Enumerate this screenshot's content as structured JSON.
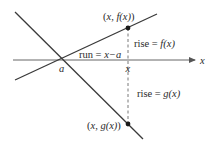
{
  "diagram": {
    "type": "two-line slope comparison",
    "colors": {
      "line": "#3a3a3a",
      "axis": "#555555",
      "dashed": "#555555",
      "point": "#1a1a1a",
      "text": "#2a2a2a"
    },
    "axis": {
      "label": "x",
      "from": [
        13,
        60
      ],
      "to": [
        197,
        60
      ]
    },
    "lines": {
      "f_line": {
        "name": "f",
        "from": [
          15,
          80
        ],
        "to": [
          157,
          14
        ]
      },
      "g_line": {
        "name": "g",
        "from": [
          15,
          12
        ],
        "to": [
          143,
          139
        ]
      }
    },
    "points": {
      "a": {
        "label": "a",
        "x": 62,
        "y": 59
      },
      "f_point": {
        "label": "(x, f(x))",
        "x": 128,
        "y": 28
      },
      "g_point": {
        "label": "(x, g(x))",
        "x": 128,
        "y": 124
      }
    },
    "labels": {
      "axis_x": "x",
      "a": "a",
      "x_tick": "x",
      "run_prefix": "run = ",
      "run_expr": "x−a",
      "rise_f_prefix": "rise = ",
      "rise_f_expr": "f(x)",
      "rise_g_prefix": "rise = ",
      "rise_g_expr": "g(x)",
      "f_point_open": "(",
      "f_point_body": "x, f(x)",
      "f_point_close": ")",
      "g_point_open": "(",
      "g_point_body": "x, g(x)",
      "g_point_close": ")"
    }
  }
}
